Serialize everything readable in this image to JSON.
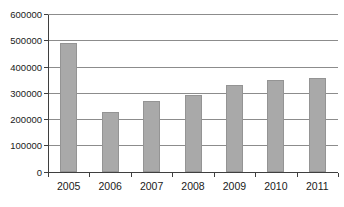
{
  "chart_data": {
    "type": "bar",
    "title": "",
    "xlabel": "",
    "ylabel": "",
    "categories": [
      "2005",
      "2006",
      "2007",
      "2008",
      "2009",
      "2010",
      "2011"
    ],
    "values": [
      490000,
      230000,
      270000,
      295000,
      330000,
      350000,
      360000
    ],
    "ylim": [
      0,
      600000
    ],
    "ytick_interval": 100000,
    "ytick_labels": [
      "0",
      "100000",
      "200000",
      "300000",
      "400000",
      "500000",
      "600000"
    ],
    "grid": "horizontal",
    "legend": "none",
    "bar_color": "#a9a9a9",
    "bar_border_color": "#949494",
    "gridline_color": "#8c8c8c",
    "axis_color": "#3f3f3f",
    "background_color": "#ffffff"
  }
}
